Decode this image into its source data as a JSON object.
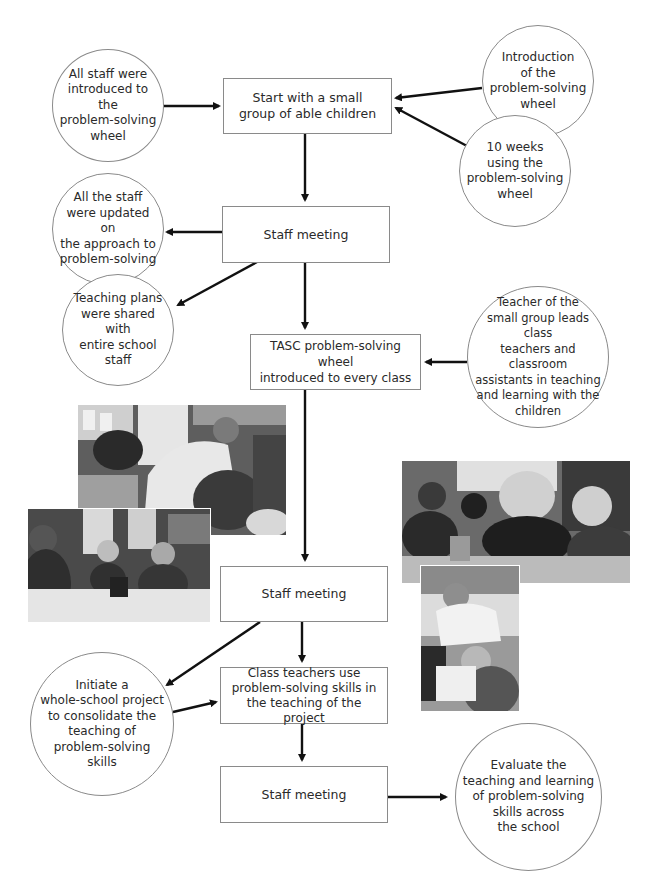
{
  "flowchart": {
    "boxes": [
      {
        "id": "start",
        "label": "Start with a small\ngroup of able children"
      },
      {
        "id": "staff-meeting-1",
        "label": "Staff meeting"
      },
      {
        "id": "tasc",
        "label": "TASC problem-solving wheel\nintroduced to every class"
      },
      {
        "id": "staff-meeting-2",
        "label": "Staff meeting"
      },
      {
        "id": "class-teachers",
        "label": "Class teachers use\nproblem-solving skills in\nthe teaching of the project"
      },
      {
        "id": "staff-meeting-3",
        "label": "Staff meeting"
      }
    ],
    "circles": [
      {
        "id": "all-staff-introduced",
        "label": "All staff were\nintroduced to the\nproblem-solving\nwheel"
      },
      {
        "id": "introduction-wheel",
        "label": "Introduction\nof the\nproblem-solving\nwheel"
      },
      {
        "id": "ten-weeks",
        "label": "10 weeks\nusing the\nproblem-solving\nwheel"
      },
      {
        "id": "staff-updated",
        "label": "All the staff\nwere updated on\nthe approach to\nproblem-solving"
      },
      {
        "id": "teaching-plans",
        "label": "Teaching plans\nwere shared with\nentire school staff"
      },
      {
        "id": "teacher-small-group",
        "label": "Teacher of the\nsmall group leads class\nteachers and classroom\nassistants in teaching\nand learning with the\nchildren"
      },
      {
        "id": "whole-school-project",
        "label": "Initiate a\nwhole-school project\nto consolidate the\nteaching of\nproblem-solving\nskills"
      },
      {
        "id": "evaluate",
        "label": "Evaluate the\nteaching and learning\nof problem-solving\nskills across\nthe school"
      }
    ],
    "photos": [
      {
        "id": "photo-teacher-leaning",
        "description": "Teacher leaning over pupils at a desk in a classroom"
      },
      {
        "id": "photo-children-table",
        "description": "Group of children seated at a table with pencil pot"
      },
      {
        "id": "photo-teacher-group",
        "description": "Teacher working with a group of boys at a desk"
      },
      {
        "id": "photo-teacher-pupil",
        "description": "Teacher bending over a pupil writing"
      }
    ],
    "colors": {
      "line": "#111111",
      "border": "#8a8a8a",
      "text": "#2a2a2a"
    }
  }
}
